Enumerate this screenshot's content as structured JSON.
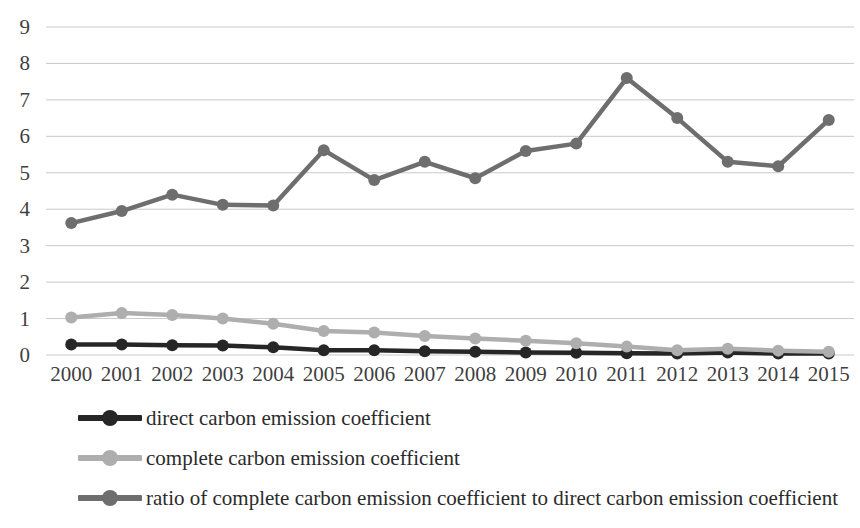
{
  "chart_data": {
    "type": "line",
    "title": "",
    "xlabel": "",
    "ylabel": "",
    "categories": [
      "2000",
      "2001",
      "2002",
      "2003",
      "2004",
      "2005",
      "2006",
      "2007",
      "2008",
      "2009",
      "2010",
      "2011",
      "2012",
      "2013",
      "2014",
      "2015"
    ],
    "ylim": [
      0,
      9
    ],
    "y_ticks": [
      0,
      1,
      2,
      3,
      4,
      5,
      6,
      7,
      8,
      9
    ],
    "y_tick_labels": [
      "0",
      "1",
      "2",
      "3",
      "4",
      "5",
      "6",
      "7",
      "8",
      "9"
    ],
    "grid": true,
    "legend_position": "bottom-left",
    "series": [
      {
        "name": "direct carbon emission coefficient",
        "color": "#262626",
        "values": [
          0.29,
          0.29,
          0.27,
          0.26,
          0.21,
          0.13,
          0.13,
          0.1,
          0.09,
          0.07,
          0.06,
          0.05,
          0.04,
          0.07,
          0.04,
          0.04
        ]
      },
      {
        "name": "complete carbon emission coefficient",
        "color": "#aeaeae",
        "values": [
          1.03,
          1.15,
          1.1,
          1.0,
          0.86,
          0.66,
          0.62,
          0.52,
          0.45,
          0.39,
          0.32,
          0.23,
          0.13,
          0.17,
          0.12,
          0.09
        ]
      },
      {
        "name": "ratio of complete carbon emission coefficient to direct carbon emission coefficient",
        "color": "#6e6e6e",
        "values": [
          3.62,
          3.95,
          4.4,
          4.12,
          4.1,
          5.62,
          4.8,
          5.3,
          4.85,
          5.6,
          5.8,
          7.6,
          6.5,
          5.3,
          5.18,
          6.45
        ]
      }
    ]
  },
  "legend": {
    "items": [
      {
        "label": "direct carbon emission coefficient",
        "color": "#262626"
      },
      {
        "label": "complete carbon emission coefficient",
        "color": "#aeaeae"
      },
      {
        "label": "ratio of complete carbon emission coefficient to direct carbon emission coefficient",
        "color": "#6e6e6e"
      }
    ]
  },
  "colors": {
    "gridline": "#c9c9c9",
    "tick_text": "#3f3f3f",
    "legend_text": "#2b2b2b",
    "background": "#ffffff"
  }
}
